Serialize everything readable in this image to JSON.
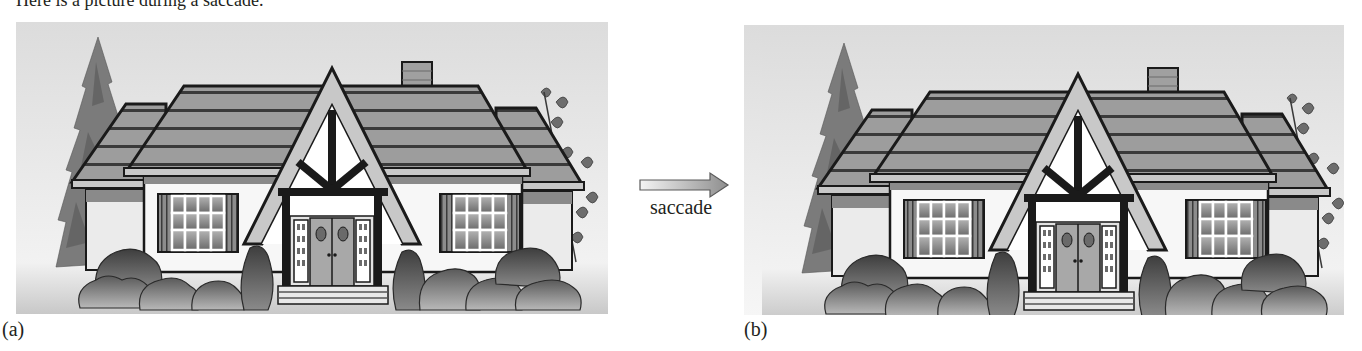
{
  "figure": {
    "top_caption": "Here is a picture during a saccade.",
    "arrow_label": "saccade",
    "arrow_color_light": "#f2f2f2",
    "arrow_color_dark": "#9a9a9a",
    "panels": [
      {
        "label": "(a)",
        "subject": "house-scene",
        "offset_x": 0,
        "offset_y": 0
      },
      {
        "label": "(b)",
        "subject": "house-scene-shifted",
        "offset_x": 18,
        "offset_y": 3
      }
    ]
  }
}
